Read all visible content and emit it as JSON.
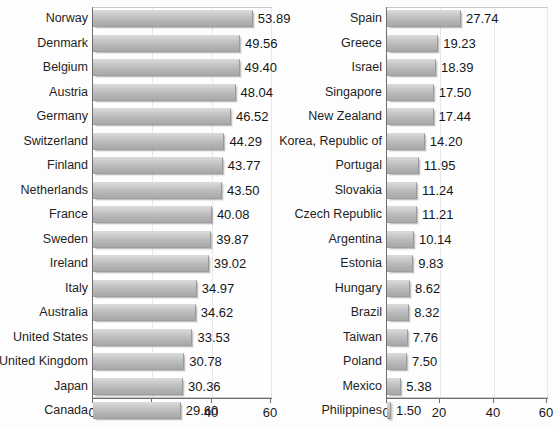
{
  "chart_data": [
    {
      "type": "bar",
      "orientation": "horizontal",
      "panel": "left",
      "title": "",
      "xlabel": "",
      "ylabel": "",
      "xlim": [
        0,
        60
      ],
      "xticks": [
        0,
        20,
        40,
        60
      ],
      "xtick_labels": [
        "0",
        "20",
        "40",
        "60"
      ],
      "grid": true,
      "legend": "none",
      "categories": [
        "Norway",
        "Denmark",
        "Belgium",
        "Austria",
        "Germany",
        "Switzerland",
        "Finland",
        "Netherlands",
        "France",
        "Sweden",
        "Ireland",
        "Italy",
        "Australia",
        "United States",
        "United Kingdom",
        "Japan",
        "Canada"
      ],
      "values": [
        53.89,
        49.56,
        49.4,
        48.04,
        46.52,
        44.29,
        43.77,
        43.5,
        40.08,
        39.87,
        39.02,
        34.97,
        34.62,
        33.53,
        30.78,
        30.36,
        29.6
      ],
      "value_labels": [
        "53.89",
        "49.56",
        "49.40",
        "48.04",
        "46.52",
        "44.29",
        "43.77",
        "43.50",
        "40.08",
        "39.87",
        "39.02",
        "34.97",
        "34.62",
        "33.53",
        "30.78",
        "30.36",
        "29.60"
      ]
    },
    {
      "type": "bar",
      "orientation": "horizontal",
      "panel": "right",
      "title": "",
      "xlabel": "",
      "ylabel": "",
      "xlim": [
        0,
        60
      ],
      "xticks": [
        0,
        20,
        40,
        60
      ],
      "xtick_labels": [
        "0",
        "20",
        "40",
        "60"
      ],
      "grid": true,
      "legend": "none",
      "categories": [
        "Spain",
        "Greece",
        "Israel",
        "Singapore",
        "New Zealand",
        "Korea, Republic of",
        "Portugal",
        "Slovakia",
        "Czech Republic",
        "Argentina",
        "Estonia",
        "Hungary",
        "Brazil",
        "Taiwan",
        "Poland",
        "Mexico",
        "Philippines"
      ],
      "values": [
        27.74,
        19.23,
        18.39,
        17.5,
        17.44,
        14.2,
        11.95,
        11.24,
        11.21,
        10.14,
        9.83,
        8.62,
        8.32,
        7.76,
        7.5,
        5.38,
        1.5
      ],
      "value_labels": [
        "27.74",
        "19.23",
        "18.39",
        "17.50",
        "17.44",
        "14.20",
        "11.95",
        "11.24",
        "11.21",
        "10.14",
        "9.83",
        "8.62",
        "8.32",
        "7.76",
        "7.50",
        "5.38",
        "1.50"
      ]
    }
  ],
  "style": {
    "bar_fill_light": "#d8d8d8",
    "bar_fill_dark": "#a9a9a9",
    "axis_color": "#6f6f6f",
    "grid_color": "#e8e8e8",
    "text_color": "#1a1a1a",
    "background": "#fdfdfd"
  }
}
